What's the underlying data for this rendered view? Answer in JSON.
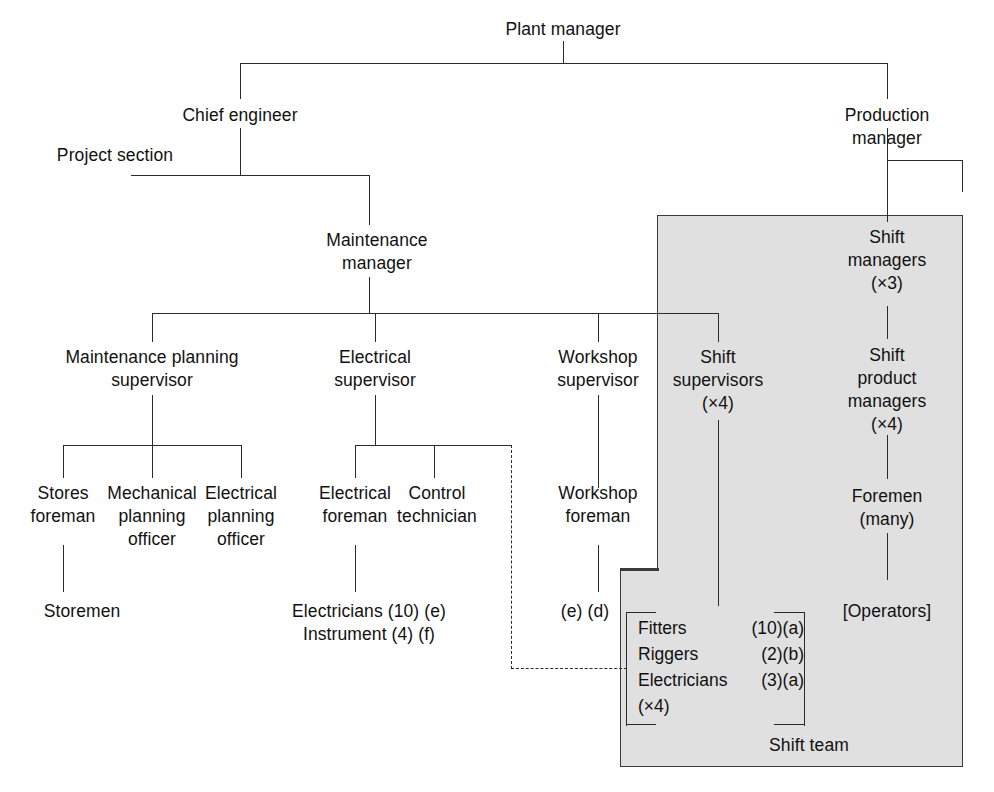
{
  "diagram": {
    "style": {
      "shaded_region_color": "#e0e0e0",
      "line_color": "#2b2b2b",
      "background": "#ffffff"
    },
    "nodes": {
      "plant_manager": "Plant manager",
      "chief_engineer": "Chief engineer",
      "project_section": "Project section",
      "production_manager": "Production manager",
      "maintenance_manager": "Maintenance\nmanager",
      "shift_managers": "Shift\nmanagers\n(×3)",
      "maintenance_planning_supervisor": "Maintenance planning\nsupervisor",
      "electrical_supervisor": "Electrical\nsupervisor",
      "workshop_supervisor": "Workshop\nsupervisor",
      "shift_supervisors": "Shift\nsupervisors\n(×4)",
      "shift_product_managers": "Shift\nproduct\nmanagers\n(×4)",
      "stores_foreman": "Stores\nforeman",
      "mechanical_planning_officer": "Mechanical\nplanning\nofficer",
      "electrical_planning_officer": "Electrical\nplanning\nofficer",
      "electrical_foreman": "Electrical\nforeman",
      "control_technician": "Control\ntechnician",
      "workshop_foreman": "Workshop\nforeman",
      "foremen": "Foremen\n(many)",
      "storemen": "Storemen",
      "electricians_instrument": "Electricians (10) (e)\nInstrument (4) (f)",
      "workshop_notes": "(e) (d)",
      "operators": "[Operators]",
      "shift_team_caption": "Shift team"
    },
    "shift_team": {
      "rows": [
        {
          "role": "Fitters",
          "count": "(10)(a)"
        },
        {
          "role": "Riggers",
          "count": "(2)(b)"
        },
        {
          "role": "Electricians",
          "count": "(3)(a)"
        }
      ],
      "multiplier": "(×4)"
    }
  }
}
